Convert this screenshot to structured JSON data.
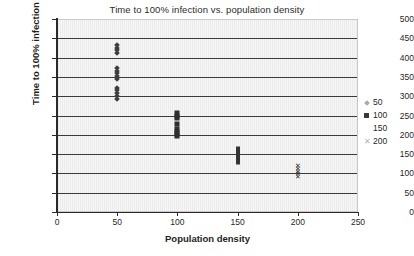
{
  "chart_data": {
    "type": "scatter",
    "title": "Time to 100% infection vs. population density",
    "xlabel": "Population density",
    "ylabel": "Time to 100% infection",
    "xlim": [
      0,
      250
    ],
    "ylim": [
      0,
      500
    ],
    "xticks": [
      0,
      50,
      100,
      150,
      200,
      250
    ],
    "yticks": [
      0,
      50,
      100,
      150,
      200,
      250,
      300,
      350,
      400,
      450,
      500
    ],
    "grid": "horizontal",
    "legend_position": "right",
    "series": [
      {
        "name": "50",
        "marker": "diamond",
        "color": "#a9a9a9",
        "points": [
          {
            "x": 50,
            "y": 432
          },
          {
            "x": 50,
            "y": 424
          },
          {
            "x": 50,
            "y": 419
          },
          {
            "x": 50,
            "y": 412
          },
          {
            "x": 50,
            "y": 373
          },
          {
            "x": 50,
            "y": 366
          },
          {
            "x": 50,
            "y": 359
          },
          {
            "x": 50,
            "y": 352
          },
          {
            "x": 50,
            "y": 345
          },
          {
            "x": 50,
            "y": 322
          },
          {
            "x": 50,
            "y": 315
          },
          {
            "x": 50,
            "y": 308
          },
          {
            "x": 50,
            "y": 301
          },
          {
            "x": 50,
            "y": 294
          }
        ]
      },
      {
        "name": "100",
        "marker": "square",
        "color": "#2e2e2e",
        "points": [
          {
            "x": 100,
            "y": 256
          },
          {
            "x": 100,
            "y": 250
          },
          {
            "x": 100,
            "y": 244
          },
          {
            "x": 100,
            "y": 228
          },
          {
            "x": 100,
            "y": 214
          },
          {
            "x": 100,
            "y": 208
          },
          {
            "x": 100,
            "y": 202
          },
          {
            "x": 100,
            "y": 196
          }
        ]
      },
      {
        "name": "150",
        "marker": "none",
        "color": "#333333",
        "points": [
          {
            "x": 150,
            "y": 162
          },
          {
            "x": 150,
            "y": 155
          },
          {
            "x": 150,
            "y": 148
          },
          {
            "x": 150,
            "y": 141
          },
          {
            "x": 150,
            "y": 130
          }
        ]
      },
      {
        "name": "200",
        "marker": "x",
        "color": "#b3b3b3",
        "points": [
          {
            "x": 200,
            "y": 122
          },
          {
            "x": 200,
            "y": 114
          },
          {
            "x": 200,
            "y": 107
          },
          {
            "x": 200,
            "y": 100
          },
          {
            "x": 200,
            "y": 94
          }
        ]
      }
    ],
    "legend": [
      {
        "label": "50",
        "marker": "diamond"
      },
      {
        "label": "100",
        "marker": "square"
      },
      {
        "label": "150",
        "marker": "none"
      },
      {
        "label": "200",
        "marker": "x"
      }
    ]
  }
}
